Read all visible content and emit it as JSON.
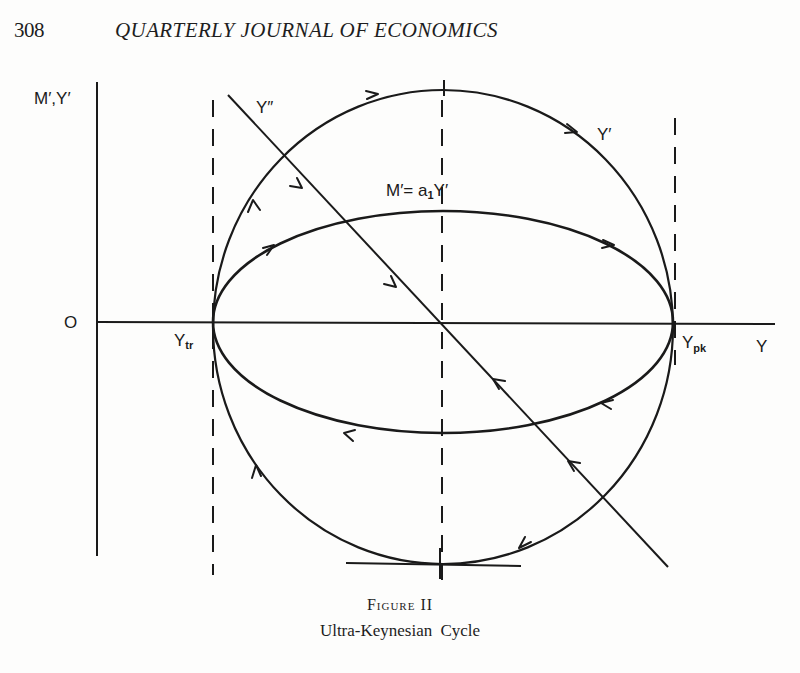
{
  "page": {
    "number": "308",
    "running_head": "QUARTERLY JOURNAL OF ECONOMICS"
  },
  "figure": {
    "title": "Figure II",
    "caption": "Ultra-Keynesian Cycle",
    "axes": {
      "y_axis_label": "M′,Y′",
      "x_axis_label": "Y",
      "origin_label": "O"
    },
    "labels": {
      "second_derivative_line": "Y″",
      "outer_curve": "Y′",
      "inner_curve": "M′= a",
      "inner_curve_subscript": "1",
      "inner_curve_suffix": "Y′",
      "trough": "Y",
      "trough_subscript": "tr",
      "peak": "Y",
      "peak_subscript": "pk"
    },
    "curves": [
      {
        "name": "Y′ (outer circle)",
        "shape": "closed loop",
        "direction": "clockwise",
        "arrows": 6
      },
      {
        "name": "M′ = a1·Y′ (inner ellipse)",
        "shape": "closed loop",
        "direction": "clockwise",
        "arrows": 5
      },
      {
        "name": "Y″",
        "shape": "straight line",
        "slope": "negative",
        "arrows": 4
      }
    ],
    "reference_lines": [
      {
        "name": "trough",
        "style": "dashed vertical",
        "at": "Y_tr"
      },
      {
        "name": "midpoint",
        "style": "dashed vertical",
        "at": "center"
      },
      {
        "name": "peak",
        "style": "dashed vertical",
        "at": "Y_pk"
      }
    ]
  }
}
